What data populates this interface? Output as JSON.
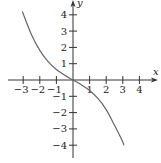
{
  "chart_data": {
    "type": "line",
    "title": "",
    "xlabel": "x",
    "ylabel": "y",
    "xlim": [
      -3.0,
      4.5
    ],
    "ylim": [
      -4.5,
      4.5
    ],
    "x_ticks": [
      -3,
      -2,
      -1,
      1,
      2,
      3,
      4
    ],
    "x_tick_labels": [
      "−3",
      "−2",
      "−1",
      "1",
      "2",
      "3",
      "4"
    ],
    "y_ticks": [
      4,
      3,
      2,
      1,
      -1,
      -2,
      -3,
      -4
    ],
    "y_tick_labels": [
      "4",
      "3",
      "2",
      "1",
      "−1",
      "−2",
      "−3",
      "−4"
    ],
    "grid": false,
    "series": [
      {
        "name": "curve",
        "color": "#666666",
        "x": [
          -3.05,
          -2.5,
          -2,
          -1.5,
          -1,
          -0.5,
          0,
          0.5,
          1,
          1.5,
          2,
          2.5,
          3,
          3.05
        ],
        "y": [
          4.2,
          2.78,
          1.82,
          1.13,
          0.64,
          0.29,
          0,
          -0.29,
          -0.64,
          -1.13,
          -1.82,
          -2.78,
          -3.8,
          -4.0
        ]
      }
    ]
  }
}
